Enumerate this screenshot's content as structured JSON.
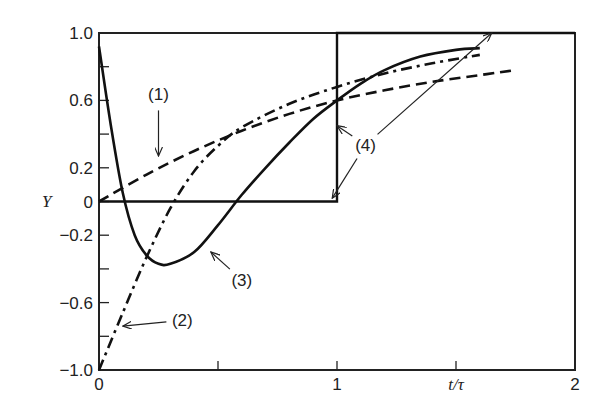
{
  "chart_data": {
    "type": "line",
    "title": "",
    "xlabel": "t/τ",
    "ylabel": "Y",
    "xlim": [
      0,
      2
    ],
    "ylim": [
      -1.0,
      1.0
    ],
    "grid": false,
    "legend": "none (curves labeled by numbered annotations with arrows)",
    "x_ticks": [
      0,
      0.5,
      1,
      1.5,
      2
    ],
    "x_tick_labels": [
      "0",
      "",
      "1",
      "t/τ",
      "2"
    ],
    "y_ticks": [
      -1.0,
      -0.8,
      -0.6,
      -0.4,
      -0.2,
      0,
      0.2,
      0.4,
      0.6,
      0.8,
      1.0
    ],
    "y_tick_labels": [
      "−1.0",
      "",
      "−0.6",
      "",
      "−0.2",
      "0",
      "0.2",
      "",
      "0.6",
      "",
      "1.0"
    ],
    "series": [
      {
        "name": "(1)",
        "style": "dashed",
        "x": [
          0,
          0.2,
          0.4,
          0.6,
          0.8,
          1.0,
          1.2,
          1.4,
          1.6,
          1.75
        ],
        "y": [
          0,
          0.16,
          0.3,
          0.42,
          0.52,
          0.6,
          0.66,
          0.71,
          0.75,
          0.78
        ]
      },
      {
        "name": "(2)",
        "style": "dash-dot",
        "x": [
          0,
          0.1,
          0.2,
          0.3,
          0.4,
          0.5,
          0.6,
          0.8,
          1.0,
          1.2,
          1.4,
          1.6
        ],
        "y": [
          -1.0,
          -0.66,
          -0.33,
          -0.04,
          0.18,
          0.33,
          0.44,
          0.58,
          0.68,
          0.76,
          0.82,
          0.87
        ]
      },
      {
        "name": "(3)",
        "style": "solid",
        "x": [
          0,
          0.05,
          0.1,
          0.15,
          0.2,
          0.25,
          0.3,
          0.4,
          0.5,
          0.6,
          0.7,
          0.8,
          0.9,
          1.0,
          1.1,
          1.2,
          1.35,
          1.5,
          1.6
        ],
        "y": [
          0.92,
          0.45,
          0.05,
          -0.2,
          -0.32,
          -0.37,
          -0.37,
          -0.3,
          -0.14,
          0.04,
          0.2,
          0.35,
          0.49,
          0.6,
          0.7,
          0.78,
          0.86,
          0.9,
          0.91
        ]
      },
      {
        "name": "(4)",
        "style": "solid (step)",
        "x": [
          0,
          1.0,
          1.0,
          2.0
        ],
        "y": [
          0,
          0,
          1.0,
          1.0
        ]
      }
    ],
    "annotations": [
      {
        "label": "(1)",
        "text_at": [
          0.25,
          0.6
        ],
        "arrow_to": [
          0.25,
          0.27
        ]
      },
      {
        "label": "(2)",
        "text_at": [
          0.35,
          -0.74
        ],
        "arrow_to": [
          0.1,
          -0.74
        ]
      },
      {
        "label": "(3)",
        "text_at": [
          0.6,
          -0.5
        ],
        "arrow_to": [
          0.47,
          -0.3
        ]
      },
      {
        "label": "(4)",
        "text_at": [
          1.12,
          0.3
        ],
        "arrows_to": [
          [
            1.0,
            0.45
          ],
          [
            0.98,
            0.02
          ],
          [
            1.65,
            1.0
          ]
        ]
      }
    ]
  }
}
